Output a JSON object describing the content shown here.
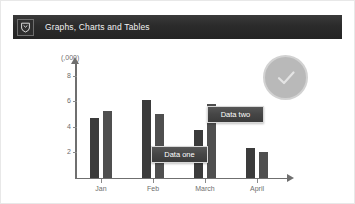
{
  "header": {
    "title": "Graphs, Charts and Tables",
    "icon": "shield-crest-icon",
    "background_color": "#2b2b2b",
    "text_color": "#f2f2f2"
  },
  "badge": {
    "icon": "check-circle-icon",
    "color": "#b9b9b9",
    "ring_color": "#d2d2d2"
  },
  "callouts": [
    {
      "label": "Data one"
    },
    {
      "label": "Data two"
    }
  ],
  "chart_data": {
    "type": "bar",
    "title": "",
    "subtitle": "",
    "xlabel": "",
    "ylabel": "(,000)",
    "categories": [
      "Jan",
      "Feb",
      "March",
      "April"
    ],
    "yticks": [
      2,
      4,
      6,
      8
    ],
    "ylim": [
      0,
      9
    ],
    "grid": false,
    "legend_position": "none",
    "axis_color": "#6f6f6f",
    "series": [
      {
        "name": "Data one",
        "color": "#3b3b3b",
        "values": [
          4.7,
          6.1,
          3.7,
          2.3
        ]
      },
      {
        "name": "Data two",
        "color": "#4f4f4f",
        "values": [
          5.2,
          5.0,
          5.8,
          2.0
        ]
      }
    ],
    "annotations": [
      {
        "text": "Data one",
        "series": "Data one"
      },
      {
        "text": "Data two",
        "series": "Data two"
      }
    ]
  }
}
